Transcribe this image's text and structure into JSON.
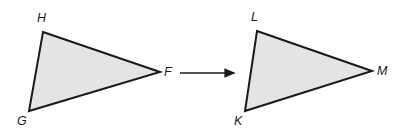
{
  "figure": {
    "background_color": "#ffffff",
    "triangle_fill_color": "#e4e4e4",
    "triangle_stroke_color": "#1a1a1a",
    "arrow_color": "#1a1a1a",
    "label_color": "#1a1a1a",
    "shapes": [
      {
        "name": "triangle-HGF",
        "labels": [
          "H",
          "G",
          "F"
        ],
        "points": "43,32 160,72 29,111",
        "vertices": [
          {
            "label": "H",
            "x": 43,
            "y": 32,
            "label_x": 37,
            "label_y": 12
          },
          {
            "label": "F",
            "x": 160,
            "y": 72,
            "label_x": 164,
            "label_y": 66
          },
          {
            "label": "G",
            "x": 29,
            "y": 111,
            "label_x": 17,
            "label_y": 115
          }
        ]
      },
      {
        "name": "triangle-LKM",
        "labels": [
          "L",
          "K",
          "M"
        ],
        "points": "257,31 372,71 245,111",
        "vertices": [
          {
            "label": "L",
            "x": 257,
            "y": 31,
            "label_x": 251,
            "label_y": 11
          },
          {
            "label": "M",
            "x": 372,
            "y": 71,
            "label_x": 377,
            "label_y": 65
          },
          {
            "label": "K",
            "x": 245,
            "y": 111,
            "label_x": 234,
            "label_y": 115
          }
        ]
      }
    ],
    "arrow": {
      "name": "transformation-arrow",
      "x1": 180,
      "y1": 73,
      "x2": 238,
      "y2": 73
    }
  }
}
